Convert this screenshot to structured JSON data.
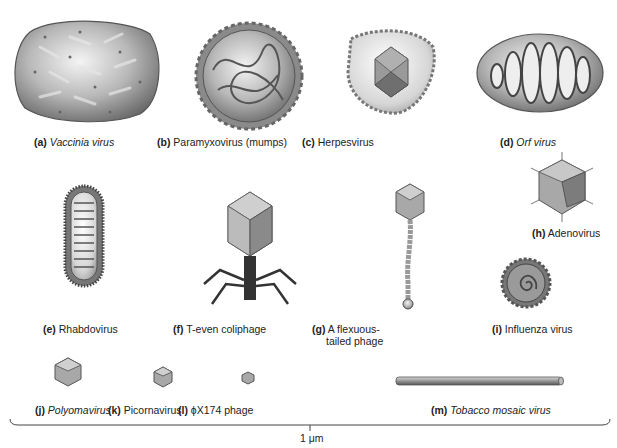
{
  "figure": {
    "viruses": [
      {
        "letter": "(a)",
        "name": "Vaccinia virus",
        "italic": true
      },
      {
        "letter": "(b)",
        "name": "Paramyxovirus (mumps)",
        "italic": false
      },
      {
        "letter": "(c)",
        "name": "Herpesvirus",
        "italic": false
      },
      {
        "letter": "(d)",
        "name": "Orf virus",
        "italic": true
      },
      {
        "letter": "(e)",
        "name": "Rhabdovirus",
        "italic": false
      },
      {
        "letter": "(f)",
        "name": "T-even coliphage",
        "italic": false
      },
      {
        "letter": "(g)",
        "name": "A flexuous-",
        "name2": "tailed phage",
        "italic": false
      },
      {
        "letter": "(h)",
        "name": "Adenovirus",
        "italic": false
      },
      {
        "letter": "(i)",
        "name": "Influenza virus",
        "italic": false
      },
      {
        "letter": "(j)",
        "name": "Polyomavirus",
        "italic": true
      },
      {
        "letter": "(k)",
        "name": "Picornavirus",
        "italic": false
      },
      {
        "letter": "(l)",
        "name": "ϕX174 phage",
        "italic": false
      },
      {
        "letter": "(m)",
        "name": "Tobacco mosaic virus",
        "italic": true
      }
    ],
    "scale_bar": {
      "label": "1 μm"
    }
  }
}
